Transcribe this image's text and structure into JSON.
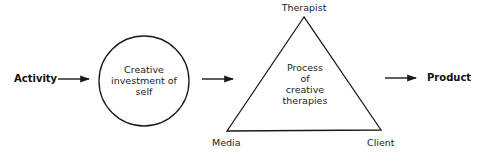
{
  "diagram": {
    "input_label": "Activity",
    "circle_lines": [
      "Creative",
      "investment of",
      "self"
    ],
    "triangle": {
      "top_vertex": "Therapist",
      "bottom_left_vertex": "Media",
      "bottom_right_vertex": "Client",
      "center_lines": [
        "Process",
        "of",
        "creative",
        "therapies"
      ]
    },
    "output_label": "Product",
    "colors": {
      "stroke": "#1a1a1a",
      "background": "#ffffff"
    }
  }
}
